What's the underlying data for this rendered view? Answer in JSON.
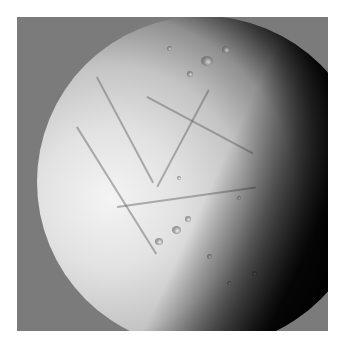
{
  "image": {
    "subject": "icy moon",
    "description": "Grayscale photograph of a cratered, fractured icy moon lit from the left with a dark terminator on the right, against a flat gray background inside a white border",
    "colors": {
      "border": "#ffffff",
      "background": "#7b7b7b",
      "lit_surface": "#f0f0f0",
      "shadow": "#000000"
    }
  }
}
